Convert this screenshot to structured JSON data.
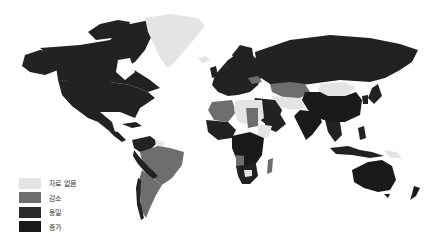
{
  "map": {
    "type": "choropleth",
    "region": "world",
    "categories": [
      {
        "key": "no_data",
        "label": "자료 없음",
        "color": "#e4e4e4"
      },
      {
        "key": "decrease",
        "label": "감소",
        "color": "#6e6e6e"
      },
      {
        "key": "same",
        "label": "동일",
        "color": "#2a2a2a"
      },
      {
        "key": "increase",
        "label": "증가",
        "color": "#1a1a1a"
      }
    ]
  },
  "legend": {
    "items": [
      {
        "label": "자료 없음",
        "color": "#e4e4e4"
      },
      {
        "label": "감소",
        "color": "#6e6e6e"
      },
      {
        "label": "동일",
        "color": "#2a2a2a"
      },
      {
        "label": "증가",
        "color": "#1a1a1a"
      }
    ]
  }
}
